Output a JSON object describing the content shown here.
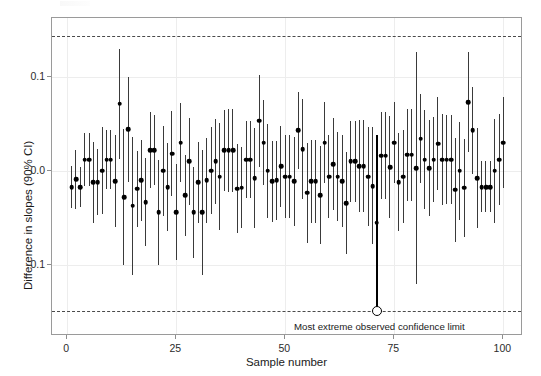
{
  "chart_data": {
    "type": "scatter",
    "title": "",
    "xlabel": "Sample number",
    "ylabel": "Difference in slopes (90% CI)",
    "xlim": [
      -3.5,
      104.5
    ],
    "ylim": [
      -0.175,
      0.162
    ],
    "xticks": [
      0,
      25,
      50,
      75,
      100
    ],
    "xticklabels": [
      "0",
      "25",
      "50",
      "75",
      "100"
    ],
    "yticks": [
      0.1,
      0.0,
      -0.1
    ],
    "yticklabels": [
      "0.1",
      "0.0",
      "-0.1"
    ],
    "grid": true,
    "legend": null,
    "annotations": [
      {
        "text": "Most extreme observed confidence limit",
        "x": 52,
        "y": -0.165
      }
    ],
    "reference_lines": [
      {
        "name": "upper-extreme-limit",
        "value": 0.143,
        "style": "dashed",
        "color": "#4a4a4a"
      },
      {
        "name": "lower-extreme-limit",
        "value": -0.148,
        "style": "dashed",
        "color": "#4a4a4a"
      }
    ],
    "highlight": {
      "sample": 71,
      "estimate": -0.055,
      "lower": -0.148,
      "upper": 0.038
    },
    "series": [
      {
        "name": "Difference in slopes with 90% confidence interval",
        "marker_color": "#000000",
        "line_color": "#3a3a3a",
        "x": [
          1,
          2,
          3,
          4,
          5,
          6,
          7,
          8,
          9,
          10,
          11,
          12,
          13,
          14,
          15,
          16,
          17,
          18,
          19,
          20,
          21,
          22,
          23,
          24,
          25,
          26,
          27,
          28,
          29,
          30,
          31,
          32,
          33,
          34,
          35,
          36,
          37,
          38,
          39,
          40,
          41,
          42,
          43,
          44,
          45,
          46,
          47,
          48,
          49,
          50,
          51,
          52,
          53,
          54,
          55,
          56,
          57,
          58,
          59,
          60,
          61,
          62,
          63,
          64,
          65,
          66,
          67,
          68,
          69,
          70,
          71,
          72,
          73,
          74,
          75,
          76,
          77,
          78,
          79,
          80,
          81,
          82,
          83,
          84,
          85,
          86,
          87,
          88,
          89,
          90,
          91,
          92,
          93,
          94,
          95,
          96,
          97,
          98,
          99,
          100
        ],
        "estimate": [
          -0.017,
          -0.009,
          -0.017,
          0.012,
          0.012,
          -0.012,
          -0.012,
          0.0,
          0.012,
          0.012,
          -0.011,
          0.071,
          -0.028,
          0.044,
          -0.037,
          -0.019,
          -0.01,
          -0.033,
          0.022,
          0.022,
          -0.044,
          0.0,
          -0.017,
          0.018,
          -0.044,
          0.03,
          -0.026,
          0.01,
          -0.044,
          -0.012,
          -0.044,
          -0.01,
          0.0,
          0.01,
          -0.006,
          0.022,
          0.022,
          0.022,
          -0.019,
          -0.018,
          0.012,
          0.012,
          -0.008,
          0.053,
          0.03,
          0.0,
          -0.011,
          -0.01,
          0.005,
          -0.006,
          -0.006,
          -0.011,
          0.043,
          0.023,
          -0.023,
          -0.011,
          -0.011,
          -0.026,
          0.03,
          -0.006,
          0.007,
          -0.006,
          -0.011,
          -0.034,
          0.01,
          0.01,
          0.005,
          0.005,
          -0.006,
          -0.016,
          -0.055,
          0.016,
          0.016,
          0.004,
          0.03,
          -0.012,
          -0.006,
          0.017,
          0.017,
          0.003,
          0.034,
          0.012,
          0.003,
          0.012,
          0.029,
          0.012,
          0.012,
          0.012,
          -0.02,
          0.0,
          -0.018,
          0.073,
          0.043,
          -0.008,
          -0.017,
          -0.017,
          -0.017,
          0.0,
          0.012,
          0.03,
          0.012
        ],
        "lower": [
          -0.039,
          -0.04,
          -0.038,
          -0.016,
          -0.016,
          -0.055,
          -0.047,
          -0.046,
          -0.019,
          -0.019,
          -0.06,
          0.013,
          -0.1,
          -0.012,
          -0.11,
          -0.059,
          -0.053,
          -0.08,
          -0.018,
          -0.015,
          -0.1,
          -0.048,
          -0.064,
          -0.027,
          -0.095,
          -0.012,
          -0.069,
          -0.036,
          -0.092,
          -0.055,
          -0.11,
          -0.055,
          -0.046,
          -0.035,
          -0.063,
          -0.021,
          -0.022,
          -0.022,
          -0.066,
          -0.061,
          -0.029,
          -0.029,
          -0.061,
          0.004,
          -0.015,
          -0.05,
          -0.054,
          -0.052,
          -0.038,
          -0.05,
          -0.05,
          -0.058,
          0.002,
          -0.03,
          -0.076,
          -0.055,
          -0.055,
          -0.078,
          -0.013,
          -0.05,
          -0.042,
          -0.053,
          -0.06,
          -0.088,
          -0.033,
          -0.033,
          -0.044,
          -0.044,
          -0.058,
          -0.078,
          -0.148,
          -0.03,
          -0.03,
          -0.05,
          -0.013,
          -0.064,
          -0.055,
          -0.032,
          -0.032,
          -0.12,
          -0.013,
          -0.04,
          -0.048,
          -0.033,
          -0.02,
          -0.036,
          -0.035,
          -0.035,
          -0.075,
          -0.052,
          -0.07,
          0.02,
          -0.003,
          -0.061,
          -0.044,
          -0.044,
          -0.044,
          -0.055,
          -0.036,
          -0.018,
          -0.035
        ],
        "upper": [
          0.005,
          0.022,
          0.004,
          0.04,
          0.04,
          0.031,
          0.023,
          0.046,
          0.043,
          0.043,
          0.038,
          0.129,
          0.044,
          0.1,
          0.036,
          0.021,
          0.033,
          0.014,
          0.062,
          0.059,
          0.012,
          0.048,
          0.03,
          0.063,
          0.007,
          0.072,
          0.017,
          0.056,
          0.004,
          0.031,
          0.022,
          0.035,
          0.046,
          0.055,
          0.051,
          0.065,
          0.066,
          0.066,
          0.028,
          0.025,
          0.053,
          0.053,
          0.045,
          0.102,
          0.075,
          0.05,
          0.032,
          0.032,
          0.048,
          0.038,
          0.038,
          0.036,
          0.084,
          0.076,
          0.03,
          0.033,
          0.033,
          0.026,
          0.073,
          0.038,
          0.056,
          0.041,
          0.038,
          0.02,
          0.053,
          0.053,
          0.054,
          0.054,
          0.046,
          0.046,
          0.038,
          0.062,
          0.062,
          0.058,
          0.073,
          0.04,
          0.043,
          0.066,
          0.066,
          0.126,
          0.081,
          0.064,
          0.054,
          0.057,
          0.078,
          0.06,
          0.059,
          0.059,
          0.035,
          0.052,
          0.034,
          0.126,
          0.089,
          0.045,
          0.01,
          0.01,
          0.01,
          0.055,
          0.06,
          0.078,
          0.059
        ]
      }
    ]
  },
  "axes": {
    "y_label": "Difference in slopes (90% CI)",
    "x_label": "Sample number"
  }
}
